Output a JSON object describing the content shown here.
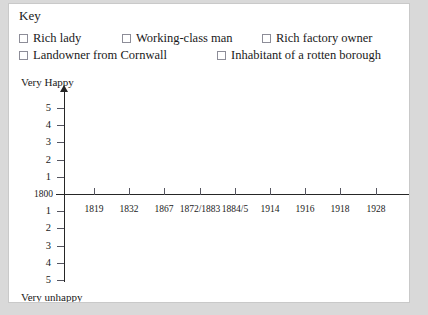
{
  "key": {
    "title": "Key",
    "rows": [
      [
        {
          "label": "Rich lady",
          "left": 0
        },
        {
          "label": "Working-class man",
          "left": 103
        },
        {
          "label": "Rich factory owner",
          "left": 243
        }
      ],
      [
        {
          "label": "Landowner from Cornwall",
          "left": 0
        },
        {
          "label": "Inhabitant of a rotten borough",
          "left": 198
        }
      ]
    ]
  },
  "chart_data": {
    "type": "line",
    "title": "",
    "xlabel": "",
    "ylabel": "",
    "axis_top_caption": "Very Happy",
    "axis_bottom_caption": "Very unhappy",
    "origin_label": "1800",
    "x_ticks": [
      "1819",
      "1832",
      "1867",
      "1872/1883",
      "1884/5",
      "1914",
      "1916",
      "1918",
      "1928"
    ],
    "y_ticks_positive": [
      "5",
      "4",
      "3",
      "2",
      "1"
    ],
    "y_ticks_negative": [
      "1",
      "2",
      "3",
      "4",
      "5"
    ],
    "ylim": [
      -5,
      5
    ],
    "grid": false,
    "legend_position": "top",
    "series": [
      {
        "name": "Rich lady",
        "values": []
      },
      {
        "name": "Working-class man",
        "values": []
      },
      {
        "name": "Rich factory owner",
        "values": []
      },
      {
        "name": "Landowner from Cornwall",
        "values": []
      },
      {
        "name": "Inhabitant of a rotten borough",
        "values": []
      }
    ]
  },
  "colors": {
    "page": "#ffffff",
    "backdrop": "#d9d9d9",
    "axis": "#262626",
    "text": "#1a1a1a",
    "checkbox_border": "#8d8d98"
  }
}
